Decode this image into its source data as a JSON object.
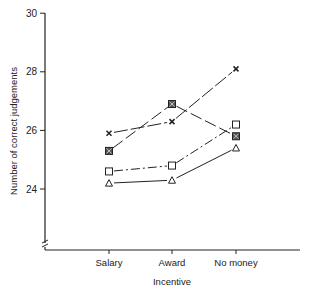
{
  "chart_data": {
    "type": "line",
    "title": "",
    "xlabel": "Incentive",
    "ylabel": "Number of correct judgements",
    "categories": [
      "Salary",
      "Award",
      "No money"
    ],
    "ylim": [
      22,
      30
    ],
    "yticks": [
      24,
      26,
      28,
      30
    ],
    "ytick_labels": [
      "24",
      "26",
      "28",
      "30"
    ],
    "axis_break": true,
    "grid": false,
    "legend": "none",
    "series": [
      {
        "name": "cross",
        "marker": "x",
        "line_style": "long-dash",
        "values": [
          25.9,
          26.3,
          28.1
        ]
      },
      {
        "name": "filled-square",
        "marker": "square-x",
        "line_style": "dash",
        "values": [
          25.3,
          26.9,
          25.8
        ]
      },
      {
        "name": "open-square",
        "marker": "square",
        "line_style": "dash-dot",
        "values": [
          24.6,
          24.8,
          26.2
        ]
      },
      {
        "name": "triangle",
        "marker": "triangle",
        "line_style": "solid",
        "values": [
          24.2,
          24.3,
          25.4
        ]
      }
    ]
  },
  "colors": {
    "ink": "#222222",
    "background": "#ffffff"
  }
}
